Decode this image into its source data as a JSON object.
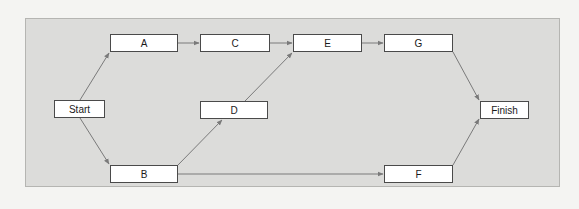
{
  "diagram": {
    "type": "network-activity-diagram",
    "colors": {
      "background": "#f4f4f2",
      "panel": "#dcdcda",
      "panel_border": "#b5b5b2",
      "node_fill": "#ffffff",
      "node_border": "#4a4a4a",
      "edge": "#7a7a7a"
    },
    "nodes": [
      {
        "id": "start",
        "label": "Start",
        "x": 54,
        "y": 100,
        "w": 51,
        "h": 18
      },
      {
        "id": "A",
        "label": "A",
        "x": 110,
        "y": 34,
        "w": 68,
        "h": 18
      },
      {
        "id": "B",
        "label": "B",
        "x": 110,
        "y": 165,
        "w": 68,
        "h": 18
      },
      {
        "id": "C",
        "label": "C",
        "x": 200,
        "y": 34,
        "w": 70,
        "h": 18
      },
      {
        "id": "D",
        "label": "D",
        "x": 200,
        "y": 101,
        "w": 68,
        "h": 18
      },
      {
        "id": "E",
        "label": "E",
        "x": 293,
        "y": 34,
        "w": 69,
        "h": 18
      },
      {
        "id": "G",
        "label": "G",
        "x": 384,
        "y": 34,
        "w": 69,
        "h": 18
      },
      {
        "id": "F",
        "label": "F",
        "x": 384,
        "y": 165,
        "w": 69,
        "h": 18
      },
      {
        "id": "finish",
        "label": "Finish",
        "x": 480,
        "y": 101,
        "w": 49,
        "h": 18
      }
    ],
    "edges": [
      {
        "from": "start",
        "to": "A",
        "x1": 80,
        "y1": 100,
        "x2": 109,
        "y2": 53
      },
      {
        "from": "start",
        "to": "B",
        "x1": 80,
        "y1": 118,
        "x2": 109,
        "y2": 164
      },
      {
        "from": "A",
        "to": "C",
        "x1": 178,
        "y1": 43,
        "x2": 199,
        "y2": 43
      },
      {
        "from": "C",
        "to": "E",
        "x1": 270,
        "y1": 43,
        "x2": 292,
        "y2": 43
      },
      {
        "from": "B",
        "to": "D",
        "x1": 178,
        "y1": 165,
        "x2": 222,
        "y2": 120
      },
      {
        "from": "D",
        "to": "E",
        "x1": 245,
        "y1": 101,
        "x2": 292,
        "y2": 53
      },
      {
        "from": "E",
        "to": "G",
        "x1": 362,
        "y1": 43,
        "x2": 383,
        "y2": 43
      },
      {
        "from": "B",
        "to": "F",
        "x1": 178,
        "y1": 174,
        "x2": 383,
        "y2": 174
      },
      {
        "from": "G",
        "to": "finish",
        "x1": 453,
        "y1": 52,
        "x2": 479,
        "y2": 100
      },
      {
        "from": "F",
        "to": "finish",
        "x1": 453,
        "y1": 165,
        "x2": 479,
        "y2": 119
      }
    ]
  }
}
